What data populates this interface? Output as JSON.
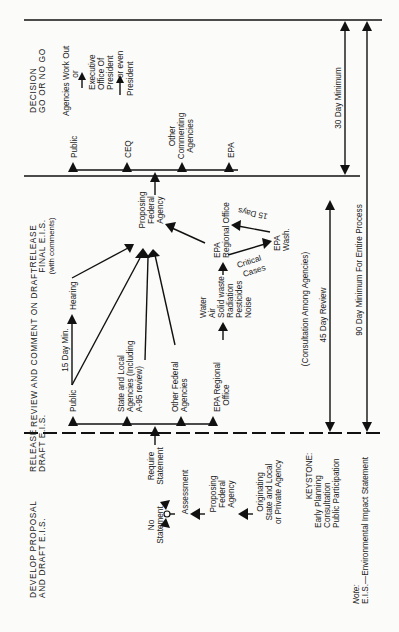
{
  "phases": [
    {
      "id": "develop",
      "lines": [
        "DEVELOP PROPOSAL",
        "AND DRAFT E.I.S."
      ]
    },
    {
      "id": "release_draft",
      "lines": [
        "RELEASE",
        "DRAFT E.I.S."
      ]
    },
    {
      "id": "review",
      "lines": [
        "REVIEW AND COMMENT ON DRAFT"
      ]
    },
    {
      "id": "release_final",
      "lines": [
        "RELEASE",
        "FINAL E.I.S.",
        "(with comments)"
      ]
    },
    {
      "id": "decision",
      "lines": [
        "DECISION",
        "GO OR NO GO"
      ]
    }
  ],
  "develop": {
    "originating": [
      "Originating",
      "State and Local",
      "or Private Agency"
    ],
    "proposing": [
      "Proposing",
      "Federal",
      "Agency"
    ],
    "assessment": "Assessment",
    "no_statement": [
      "No",
      "Statement"
    ],
    "require_statement": [
      "Require",
      "Statement"
    ],
    "keystone": [
      "KEYSTONE:",
      "Early Planning",
      "Consultation",
      "Public Participation"
    ]
  },
  "review": {
    "public": "Public",
    "fifteen_day": "15 Day Min.",
    "hearing": "Hearing",
    "state_local": [
      "State and Local",
      "Agencies (Including",
      "A-95 review)"
    ],
    "other_federal": [
      "Other Federal",
      "Agencies"
    ],
    "epa_regional": [
      "EPA Regional",
      "Office"
    ],
    "epa_topics": [
      "Water",
      "Air",
      "Solid waste",
      "Radiation",
      "Pesticides",
      "Noise"
    ],
    "epa_regional_office": [
      "EPA",
      "Regional Office"
    ],
    "critical_cases": [
      "Critical",
      "Cases"
    ],
    "epa_wash": [
      "EPA",
      "Wash."
    ],
    "fifteen_days": "15 Days",
    "consultation": "(Consultation Among Agencies)",
    "forty_five": "45 Day Review"
  },
  "final": {
    "proposing": [
      "Proposing",
      "Federal",
      "Agency"
    ]
  },
  "decision": {
    "public": "Public",
    "ceq": "CEQ",
    "other_commenting": [
      "Other",
      "Commenting",
      "Agencies"
    ],
    "epa": "EPA",
    "work_out": "Agencies Work Out",
    "or": "or",
    "exec_office": [
      "Executive",
      "Office Of",
      "President"
    ],
    "or_even": "or even",
    "president": "President",
    "thirty_day": "30 Day Minimum"
  },
  "ninety_day": "90 Day Minimum For Entire Process",
  "note": {
    "label": "Note:",
    "text": "E.I.S.—Environmental Impact Statement"
  }
}
